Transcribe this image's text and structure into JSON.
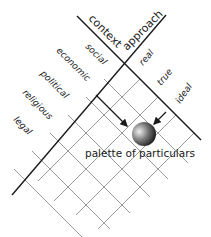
{
  "diagram": {
    "axes": {
      "context_label": "context",
      "approach_label": "approach"
    },
    "context_items": [
      "social",
      "economic",
      "political",
      "religious",
      "legal"
    ],
    "approach_items": [
      "real",
      "true",
      "ideal"
    ],
    "focus_label": "palette of particulars",
    "colors": {
      "main_line": "#1a1a1a",
      "grid_line": "#9a9a9a",
      "text": "#1a1a1a",
      "sphere_light": "#e8e8e8",
      "sphere_dark": "#111111"
    }
  }
}
